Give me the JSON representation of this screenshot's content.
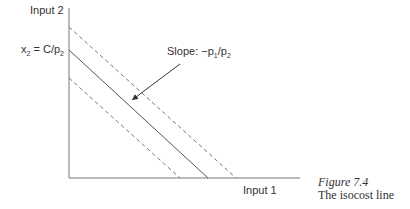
{
  "diagram": {
    "y_axis_label": "Input 2",
    "x_axis_label": "Input 1",
    "intercept_label": {
      "var": "x",
      "var_sub": "2",
      "eq": " = C/p",
      "p_sub": "2"
    },
    "slope_label": {
      "prefix": "Slope: −p",
      "sub1": "1",
      "mid": "/p",
      "sub2": "2"
    },
    "lines": [
      {
        "name": "lower-isocost",
        "style": "dashed",
        "y_intercept_px": 78,
        "x_intercept_px": 180
      },
      {
        "name": "isocost",
        "style": "solid",
        "y_intercept_px": 50,
        "x_intercept_px": 208
      },
      {
        "name": "higher-isocost",
        "style": "dashed",
        "y_intercept_px": 27,
        "x_intercept_px": 236
      }
    ]
  },
  "caption": {
    "title": "Figure 7.4",
    "text": "The isocost line"
  },
  "colors": {
    "line": "#555555",
    "dashed": "#777777"
  }
}
